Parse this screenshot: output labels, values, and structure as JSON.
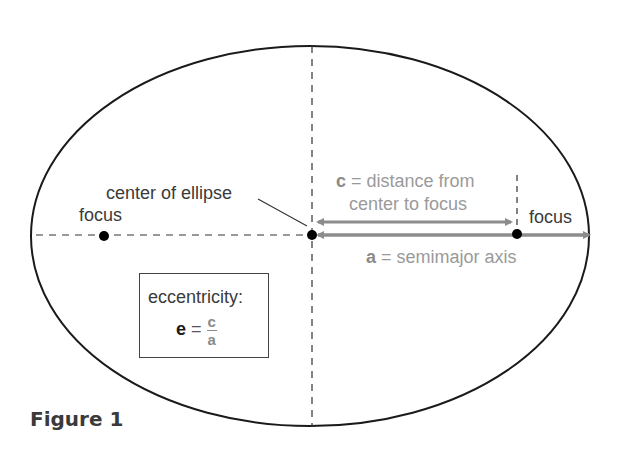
{
  "diagram": {
    "title": "Figure 1",
    "labels": {
      "center": "center of ellipse",
      "focus_left": "focus",
      "focus_right": "focus",
      "c_var": "c",
      "c_desc_line1": " = distance from",
      "c_desc_line2": "center to focus",
      "a_var": "a",
      "a_desc": " = semimajor axis"
    },
    "eccentricity_box": {
      "heading": "eccentricity:",
      "lhs": "e",
      "equals": " = ",
      "numerator": "c",
      "denominator": "a"
    },
    "colors": {
      "outline": "#1a1a1a",
      "arrow": "#8c8c8c",
      "label_gray": "#9a9a9a",
      "text_dark": "#3a3a3a"
    },
    "geometry": {
      "ellipse_center": [
        310,
        236
      ],
      "semi_major_px": 280,
      "semi_minor_px": 190,
      "focus_left_x": 103,
      "focus_right_x": 517
    }
  }
}
